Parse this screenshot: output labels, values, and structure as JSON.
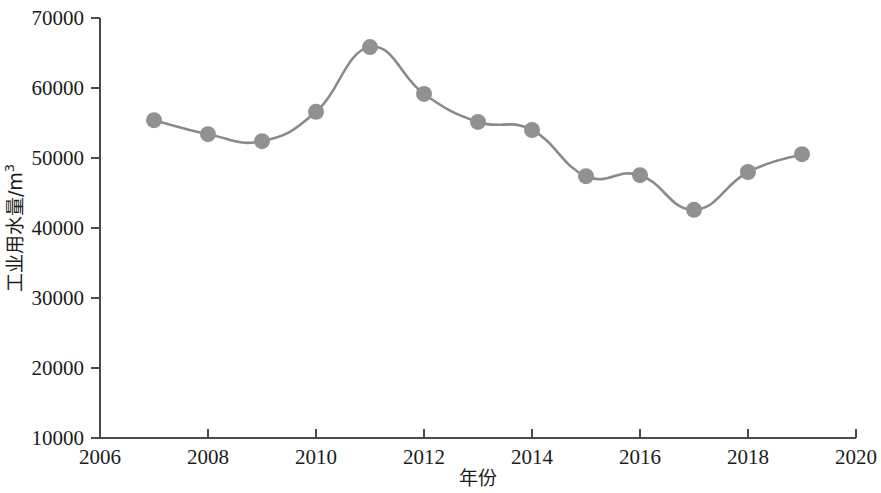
{
  "chart_data": {
    "type": "line",
    "title": "",
    "subtitle": "",
    "xlabel": "年份",
    "ylabel": "工业用水量/m³",
    "ylabel_base": "工业用水量/m",
    "ylabel_sup": "3",
    "x": [
      2007,
      2008,
      2009,
      2010,
      2011,
      2012,
      2013,
      2014,
      2015,
      2016,
      2017,
      2018,
      2019
    ],
    "categories": [
      "2007",
      "2008",
      "2009",
      "2010",
      "2011",
      "2012",
      "2013",
      "2014",
      "2015",
      "2016",
      "2017",
      "2018",
      "2019"
    ],
    "values": [
      55400,
      53400,
      52400,
      56600,
      65850,
      59150,
      55150,
      54000,
      47400,
      47550,
      42600,
      48000,
      50550
    ],
    "series": [
      {
        "name": "工业用水量",
        "values": [
          55400,
          53400,
          52400,
          56600,
          65850,
          59150,
          55150,
          54000,
          47400,
          47550,
          42600,
          48000,
          50550
        ]
      }
    ],
    "xlim": [
      2006,
      2020
    ],
    "ylim": [
      10000,
      70000
    ],
    "x_ticks": [
      2006,
      2008,
      2010,
      2012,
      2014,
      2016,
      2018,
      2020
    ],
    "x_tick_labels": [
      "2006",
      "2008",
      "2010",
      "2012",
      "2014",
      "2016",
      "2018",
      "2020"
    ],
    "y_ticks": [
      10000,
      20000,
      30000,
      40000,
      50000,
      60000,
      70000
    ],
    "y_tick_labels": [
      "10000",
      "20000",
      "30000",
      "40000",
      "50000",
      "60000",
      "70000"
    ],
    "grid": false,
    "legend": false,
    "legend_position": "none",
    "marker": "circle",
    "smoothing": true,
    "colors": {
      "line": "#8a8a8a",
      "marker": "#919191",
      "axis": "#4a4a4a",
      "text": "#1b1b1b",
      "background": "#ffffff"
    }
  },
  "geometry": {
    "plot_left": 100,
    "plot_right": 856,
    "plot_top": 18,
    "plot_bottom": 438,
    "line_width": 2.6,
    "marker_radius": 8
  }
}
